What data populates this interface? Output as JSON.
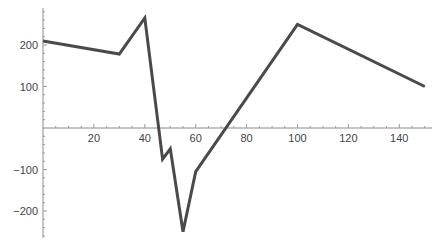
{
  "chart_data": {
    "type": "line",
    "title": "",
    "xlabel": "",
    "ylabel": "",
    "xlim": [
      0,
      155
    ],
    "ylim": [
      -270,
      290
    ],
    "grid": false,
    "legend": null,
    "x_ticks": [
      20,
      40,
      60,
      80,
      100,
      120,
      140
    ],
    "x_tick_labels": [
      "20",
      "40",
      "60",
      "80",
      "100",
      "120",
      "140"
    ],
    "y_ticks": [
      -200,
      -100,
      100,
      200
    ],
    "y_tick_labels": [
      "−200",
      "−100",
      "100",
      "200"
    ],
    "series": [
      {
        "name": "series-1",
        "color": "#4a4a4a",
        "x": [
          0,
          30,
          40,
          47,
          50,
          55,
          60,
          100,
          150
        ],
        "y": [
          210,
          178,
          265,
          -75,
          -50,
          -250,
          -105,
          250,
          100
        ]
      }
    ]
  }
}
